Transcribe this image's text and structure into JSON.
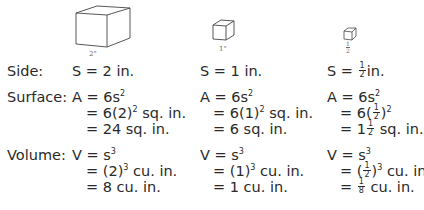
{
  "cubes": [
    {
      "id": "large",
      "label": "2\""
    },
    {
      "id": "medium",
      "label": "1\""
    },
    {
      "id": "small",
      "label_num": "1",
      "label_den": "2",
      "label_suffix": "\""
    }
  ],
  "row_labels": {
    "side": "Side:",
    "surface": "Surface:",
    "volume": "Volume:"
  },
  "columns": [
    {
      "side": "S = 2 in.",
      "surface": [
        "A = 6s",
        "= 6(2)",
        " sq. in.",
        "= 24 sq. in."
      ],
      "volume": [
        "V = s",
        "= (2)",
        " cu. in.",
        "= 8 cu. in."
      ]
    },
    {
      "side": "S = 1 in.",
      "surface": [
        "A = 6s",
        "= 6(1)",
        " sq. in.",
        "= 6 sq. in."
      ],
      "volume": [
        "V = s",
        "= (1)",
        " cu. in.",
        "= 1 cu. in."
      ]
    },
    {
      "side_prefix": "S = ",
      "side_suffix": "in.",
      "surface": [
        "A = 6s",
        "= 6(",
        ")",
        "= 1",
        " sq. in."
      ],
      "volume": [
        "V = s",
        "= (",
        ")",
        " cu. in.",
        "= ",
        " cu. in."
      ]
    }
  ],
  "exponents": {
    "square": "2",
    "cube": "3"
  },
  "fractions": {
    "half": {
      "num": "1",
      "den": "2"
    },
    "eighth": {
      "num": "1",
      "den": "8"
    }
  }
}
